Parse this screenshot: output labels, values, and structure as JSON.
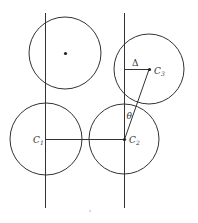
{
  "diagram": {
    "colors": {
      "stroke": "#333333",
      "background": "#ffffff"
    },
    "lines": {
      "left_vertical": {
        "x": 45,
        "y1": 13,
        "y2": 208
      },
      "right_vertical": {
        "x": 124,
        "y1": 13,
        "y2": 208
      }
    },
    "circles": [
      {
        "id": "top-left",
        "cx": 65,
        "cy": 53,
        "r": 36,
        "center_dot": true,
        "label": ""
      },
      {
        "id": "c3",
        "cx": 149,
        "cy": 69,
        "r": 35,
        "center_dot": true,
        "label": "C",
        "sub": "3"
      },
      {
        "id": "c1",
        "cx": 46,
        "cy": 139,
        "r": 36,
        "center_dot": false,
        "label": "C",
        "sub": "1"
      },
      {
        "id": "c2",
        "cx": 124,
        "cy": 139,
        "r": 35,
        "center_dot": true,
        "label": "C",
        "sub": "2"
      }
    ],
    "labels": {
      "delta": "Δ",
      "theta": "θ",
      "c1": "C",
      "c1_sub": "1",
      "c2": "C",
      "c2_sub": "2",
      "c3": "C",
      "c3_sub": "3"
    }
  }
}
